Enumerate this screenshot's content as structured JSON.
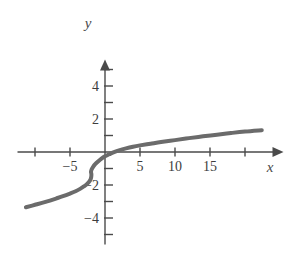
{
  "chart_data": {
    "type": "line",
    "title": "",
    "xlabel": "x",
    "ylabel": "y",
    "xlim": [
      -12.5,
      25.5
    ],
    "ylim": [
      -5.6,
      5.6
    ],
    "grid": false,
    "legend": null,
    "axis_style": "arrow-tipped cartesian axes through origin",
    "x_ticks": [
      -10,
      -5,
      5,
      10,
      15,
      20
    ],
    "x_tick_labels": [
      "",
      "-5",
      "5",
      "10",
      "15",
      ""
    ],
    "y_ticks": [
      -5,
      -4,
      -3,
      -2,
      -1,
      1,
      2,
      3,
      4,
      5
    ],
    "y_tick_labels": [
      "",
      "-4",
      "",
      "-2",
      "",
      "",
      "2",
      "",
      "4",
      ""
    ],
    "series": [
      {
        "name": "cube-root curve",
        "color": "#6b6b6b",
        "linewidth": 4,
        "description": "increasing cube-root shaped curve with inflection near x=-2, crossing y-axis near y=-1 and x-axis near x=1",
        "points": [
          [
            -11.3,
            -3.35
          ],
          [
            -10.0,
            -3.2
          ],
          [
            -8.5,
            -3.02
          ],
          [
            -7.0,
            -2.82
          ],
          [
            -6.0,
            -2.68
          ],
          [
            -5.0,
            -2.52
          ],
          [
            -4.2,
            -2.38
          ],
          [
            -3.5,
            -2.22
          ],
          [
            -3.0,
            -2.08
          ],
          [
            -2.6,
            -1.95
          ],
          [
            -2.3,
            -1.82
          ],
          [
            -2.1,
            -1.7
          ],
          [
            -2.0,
            -1.58
          ],
          [
            -1.95,
            -1.45
          ],
          [
            -1.95,
            -1.32
          ],
          [
            -2.0,
            -1.2
          ],
          [
            -1.9,
            -1.05
          ],
          [
            -1.7,
            -0.9
          ],
          [
            -1.4,
            -0.74
          ],
          [
            -1.0,
            -0.58
          ],
          [
            -0.5,
            -0.4
          ],
          [
            0.0,
            -0.26
          ],
          [
            0.6,
            -0.14
          ],
          [
            1.2,
            -0.02
          ],
          [
            2.0,
            0.1
          ],
          [
            3.0,
            0.22
          ],
          [
            4.0,
            0.32
          ],
          [
            5.0,
            0.4
          ],
          [
            6.5,
            0.5
          ],
          [
            8.0,
            0.6
          ],
          [
            10.0,
            0.72
          ],
          [
            12.0,
            0.84
          ],
          [
            14.0,
            0.95
          ],
          [
            16.0,
            1.05
          ],
          [
            18.0,
            1.15
          ],
          [
            20.0,
            1.24
          ],
          [
            22.4,
            1.32
          ]
        ]
      }
    ],
    "annotations": []
  },
  "figure": {
    "background": "#ffffff",
    "axis_color": "#4a4a4a",
    "curve_color": "#6b6b6b",
    "label_color": "#3d3d3d"
  }
}
